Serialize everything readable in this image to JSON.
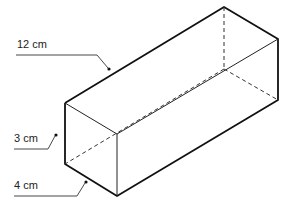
{
  "diagram": {
    "type": "cuboid",
    "labels": {
      "length": "12 cm",
      "height": "3 cm",
      "width": "4 cm"
    },
    "colors": {
      "line": "#111111",
      "background": "#ffffff"
    }
  }
}
